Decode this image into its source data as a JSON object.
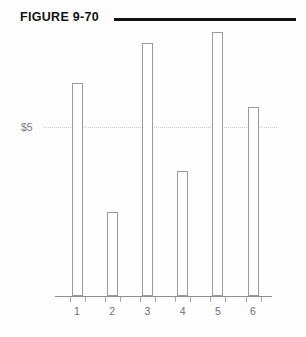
{
  "figure": {
    "title": "FIGURE 9-70",
    "rule_color": "#111111"
  },
  "axes": {
    "y_tick_label": "$5",
    "x_tick_labels": [
      "1",
      "2",
      "3",
      "4",
      "5",
      "6"
    ],
    "gridline_color": "#c9c9c9",
    "axis_color": "#8d8d8d"
  },
  "chart_data": {
    "type": "bar",
    "title": "FIGURE 9-70",
    "xlabel": "",
    "ylabel": "",
    "categories": [
      "1",
      "2",
      "3",
      "4",
      "5",
      "6"
    ],
    "values": [
      6.3,
      2.5,
      7.5,
      3.7,
      7.8,
      5.6
    ],
    "ylim": [
      0,
      8.5
    ],
    "yticks": [
      5
    ],
    "ytick_labels": [
      "$5"
    ],
    "grid": true,
    "legend": "none",
    "bar_fill": "#ffffff",
    "bar_edge_color": "#9a9a9a"
  }
}
